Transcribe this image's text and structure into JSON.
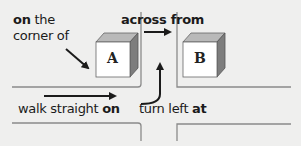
{
  "diagram": {
    "labels": {
      "on_corner": {
        "bold": "on",
        "rest_line1": " the",
        "line2": "corner of"
      },
      "across_from": {
        "bold": "across from"
      },
      "walk_straight_on": {
        "plain": "walk straight ",
        "bold": "on"
      },
      "turn_left_at": {
        "plain": "turn left ",
        "bold": "at"
      }
    },
    "buildings": [
      {
        "id": "A",
        "letter": "A"
      },
      {
        "id": "B",
        "letter": "B"
      }
    ],
    "colors": {
      "background": "#efefee",
      "road_line": "#8a8a8a",
      "arrow": "#1b1b1b",
      "box_front": "#ffffff",
      "box_top": "#b9b9b9",
      "box_side": "#7d7d7d"
    }
  }
}
